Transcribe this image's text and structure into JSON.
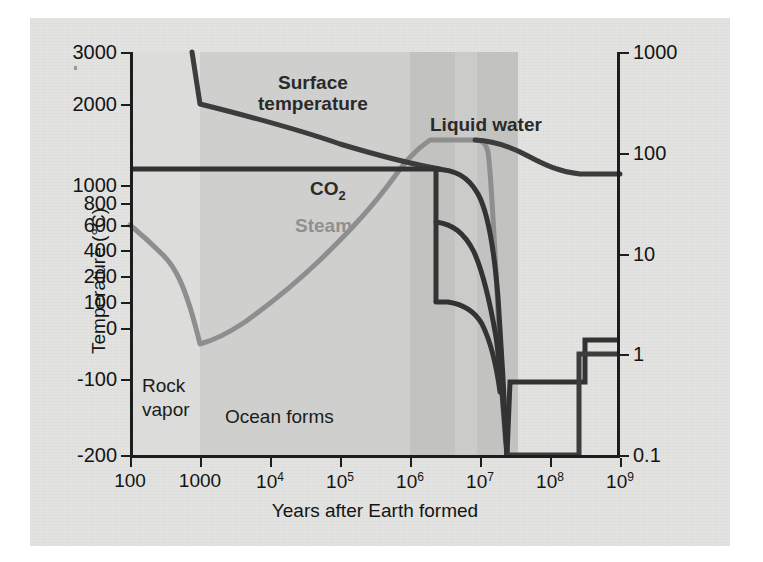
{
  "chart_data": {
    "type": "line",
    "title": "",
    "xlabel": "Years after Earth formed",
    "ylabel_left": "Temperature (°C)",
    "ylabel_right": "Amount of gas or liquid (bars)",
    "x_scale": "log",
    "xlim": [
      100,
      1000000000
    ],
    "x_ticks": [
      "100",
      "1000",
      "10⁴",
      "10⁵",
      "10⁶",
      "10⁷",
      "10⁸",
      "10⁹"
    ],
    "x_tick_values": [
      100,
      1000,
      10000,
      100000,
      1000000,
      10000000,
      100000000,
      1000000000
    ],
    "y_left_ticks": [
      "3000",
      "2000",
      "1000",
      "800",
      "600",
      "400",
      "200",
      "100",
      "0",
      "-100",
      "-200"
    ],
    "y_left_values": [
      3000,
      2000,
      1000,
      800,
      600,
      400,
      200,
      100,
      0,
      -100,
      -200
    ],
    "y_right_ticks": [
      "1000",
      "100",
      "10",
      "1",
      "0.1"
    ],
    "y_right_values": [
      1000,
      100,
      10,
      1,
      0.1
    ],
    "y_right_scale": "log",
    "grid": false,
    "legend": "inline-annotations",
    "series": [
      {
        "name": "Surface temperature",
        "axis": "left",
        "color": "#3c3c3c",
        "points": [
          [
            400,
            3000
          ],
          [
            1000,
            2000
          ],
          [
            100000,
            1750
          ],
          [
            1000000,
            1450
          ],
          [
            3000000,
            1250
          ],
          [
            10000000,
            1150
          ]
        ]
      },
      {
        "name": "CO2",
        "axis": "right",
        "color": "#333333",
        "points": [
          [
            100,
            100
          ],
          [
            1000000,
            100
          ],
          [
            2000000,
            100
          ],
          [
            2000000,
            5
          ],
          [
            4000000,
            4.2
          ],
          [
            10000000,
            3.0
          ],
          [
            20000000,
            0.6
          ],
          [
            30000000,
            0.1
          ],
          [
            600000000,
            0.1
          ],
          [
            600000000,
            1.0
          ],
          [
            1000000000,
            1.0
          ]
        ]
      },
      {
        "name": "CO2 secondary",
        "axis": "right",
        "color": "#333333",
        "points": [
          [
            2000000,
            100
          ],
          [
            4000000,
            95
          ],
          [
            10000000,
            40
          ],
          [
            18000000,
            10
          ],
          [
            22000000,
            2.0
          ],
          [
            30000000,
            0.5
          ],
          [
            600000000,
            0.5
          ],
          [
            600000000,
            1.5
          ],
          [
            1000000000,
            1.5
          ]
        ]
      },
      {
        "name": "CO2 tertiary",
        "axis": "right",
        "color": "#333333",
        "points": [
          [
            2000000,
            28
          ],
          [
            4000000,
            24
          ],
          [
            10000000,
            12
          ],
          [
            18000000,
            3.0
          ],
          [
            22000000,
            0.8
          ],
          [
            26000000,
            0.2
          ]
        ]
      },
      {
        "name": "Steam",
        "axis": "right",
        "color": "#8e8e8e",
        "points": [
          [
            100,
            600
          ],
          [
            600,
            400
          ],
          [
            1000,
            130
          ],
          [
            3000,
            170
          ],
          [
            10000,
            230
          ],
          [
            100000,
            420
          ],
          [
            400000,
            700
          ],
          [
            1000000,
            1050
          ],
          [
            1600000,
            1600
          ],
          [
            2000000,
            2500
          ],
          [
            5000000,
            2500
          ],
          [
            20000000,
            2200
          ],
          [
            22000000,
            100
          ],
          [
            24000000,
            0.1
          ],
          [
            1000000000,
            0.1
          ]
        ],
        "note": "Steam curve plotted against left temperature axis in early phase, transitions to liquid water plateau at top right"
      }
    ],
    "shaded_regions": [
      {
        "label": "Rock vapor",
        "x_from": 100,
        "x_to": 1000,
        "shade": "light"
      },
      {
        "label": "Ocean forms",
        "x_from": 1000,
        "x_to": 10000000,
        "shade": "medium"
      },
      {
        "label": "Liquid water",
        "x_from": 2000000,
        "x_to": 20000000,
        "shade": "dark"
      }
    ],
    "annotations": [
      {
        "text": "Surface temperature",
        "role": "curve-label"
      },
      {
        "text": "CO2",
        "role": "curve-label"
      },
      {
        "text": "Steam",
        "role": "curve-label"
      },
      {
        "text": "Liquid water",
        "role": "region-label"
      },
      {
        "text": "Rock vapor",
        "role": "region-label"
      },
      {
        "text": "Ocean forms",
        "role": "region-label"
      }
    ]
  },
  "axes": {
    "left_title": "Temperature (°C)",
    "right_title": "Amount of gas or liquid (bars)",
    "x_title": "Years after Earth formed",
    "left_ticks": [
      {
        "label": "3000",
        "y": 0
      },
      {
        "label": "2000",
        "y": 52
      },
      {
        "label": "1000",
        "y": 133
      },
      {
        "label": "800",
        "y": 151
      },
      {
        "label": "600",
        "y": 173
      },
      {
        "label": "400",
        "y": 198
      },
      {
        "label": "200",
        "y": 224
      },
      {
        "label": "100",
        "y": 250
      },
      {
        "label": "0",
        "y": 276
      },
      {
        "label": "-100",
        "y": 327
      },
      {
        "label": "-200",
        "y": 403
      }
    ],
    "right_ticks": [
      {
        "label": "1000",
        "y": 0
      },
      {
        "label": "100",
        "y": 101
      },
      {
        "label": "10",
        "y": 202
      },
      {
        "label": "1",
        "y": 302
      },
      {
        "label": "0.1",
        "y": 403
      }
    ],
    "x_ticks": [
      {
        "label": "100",
        "sup": "",
        "x": 0
      },
      {
        "label": "1000",
        "sup": "",
        "x": 70
      },
      {
        "label": "10",
        "sup": "4",
        "x": 140
      },
      {
        "label": "10",
        "sup": "5",
        "x": 210
      },
      {
        "label": "10",
        "sup": "6",
        "x": 280
      },
      {
        "label": "10",
        "sup": "7",
        "x": 350
      },
      {
        "label": "10",
        "sup": "8",
        "x": 420
      },
      {
        "label": "10",
        "sup": "9",
        "x": 490
      }
    ]
  },
  "labels": {
    "surface_temperature_line1": "Surface",
    "surface_temperature_line2": "temperature",
    "co2": "CO",
    "co2_sub": "2",
    "steam": "Steam",
    "liquid_water": "Liquid water",
    "rock_vapor_line1": "Rock",
    "rock_vapor_line2": "vapor",
    "ocean_forms": "Ocean forms"
  },
  "colors": {
    "paper": "#e3e3e1",
    "dark_curve": "#3c3c3c",
    "steam_curve": "#8e8e8e",
    "band_light": "#dcdcda",
    "band_medium": "#cfcfcd",
    "band_dark": "#c2c2c0",
    "axis": "#1d1d1d",
    "text": "#141414"
  }
}
